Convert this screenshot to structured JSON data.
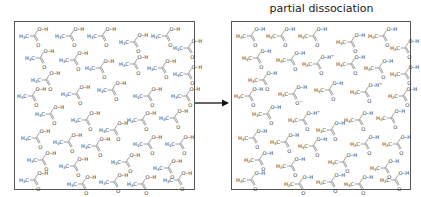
{
  "title": "partial dissociation",
  "arrow": {
    "from_x": 195,
    "to_x": 229,
    "y": 103,
    "color": "#111111"
  },
  "colors": {
    "box_border": "#555555",
    "text": "#333333"
  },
  "molecule": {
    "formula": "CH3COOH",
    "labels": {
      "methyl": "H",
      "methyl_sub": "3",
      "methyl_c": "C",
      "oh": "O–H",
      "carbonyl_o": "O",
      "anion_o": "O",
      "minus": "−",
      "plus": "+"
    }
  },
  "left_box": {
    "label": "undissociated",
    "x": 14,
    "y": 21,
    "w": 181,
    "h": 169,
    "molecules": [
      {
        "x": 4,
        "y": 2,
        "state": "neutral"
      },
      {
        "x": 40,
        "y": 2,
        "state": "neutral"
      },
      {
        "x": 72,
        "y": 2,
        "state": "neutral"
      },
      {
        "x": 104,
        "y": 8,
        "state": "neutral"
      },
      {
        "x": 136,
        "y": 2,
        "state": "neutral"
      },
      {
        "x": 158,
        "y": 14,
        "state": "neutral"
      },
      {
        "x": 10,
        "y": 24,
        "state": "neutral"
      },
      {
        "x": 44,
        "y": 26,
        "state": "neutral"
      },
      {
        "x": 70,
        "y": 34,
        "state": "neutral"
      },
      {
        "x": 104,
        "y": 30,
        "state": "neutral"
      },
      {
        "x": 132,
        "y": 34,
        "state": "neutral"
      },
      {
        "x": 158,
        "y": 40,
        "state": "neutral"
      },
      {
        "x": 16,
        "y": 46,
        "state": "neutral"
      },
      {
        "x": 82,
        "y": 56,
        "state": "neutral"
      },
      {
        "x": 118,
        "y": 62,
        "state": "neutral"
      },
      {
        "x": 156,
        "y": 62,
        "state": "neutral"
      },
      {
        "x": 2,
        "y": 62,
        "state": "neutral"
      },
      {
        "x": 46,
        "y": 60,
        "state": "neutral"
      },
      {
        "x": 20,
        "y": 80,
        "state": "neutral"
      },
      {
        "x": 56,
        "y": 86,
        "state": "neutral"
      },
      {
        "x": 84,
        "y": 96,
        "state": "neutral"
      },
      {
        "x": 112,
        "y": 86,
        "state": "neutral"
      },
      {
        "x": 144,
        "y": 84,
        "state": "neutral"
      },
      {
        "x": 6,
        "y": 104,
        "state": "neutral"
      },
      {
        "x": 38,
        "y": 108,
        "state": "neutral"
      },
      {
        "x": 66,
        "y": 112,
        "state": "neutral"
      },
      {
        "x": 118,
        "y": 110,
        "state": "neutral"
      },
      {
        "x": 150,
        "y": 110,
        "state": "neutral"
      },
      {
        "x": 12,
        "y": 126,
        "state": "neutral"
      },
      {
        "x": 44,
        "y": 132,
        "state": "neutral"
      },
      {
        "x": 96,
        "y": 128,
        "state": "neutral"
      },
      {
        "x": 138,
        "y": 134,
        "state": "neutral"
      },
      {
        "x": 4,
        "y": 146,
        "state": "neutral"
      },
      {
        "x": 52,
        "y": 150,
        "state": "neutral"
      },
      {
        "x": 84,
        "y": 148,
        "state": "neutral"
      },
      {
        "x": 112,
        "y": 150,
        "state": "neutral"
      },
      {
        "x": 148,
        "y": 146,
        "state": "neutral"
      }
    ]
  },
  "right_box": {
    "label": "partially dissociated",
    "x": 231,
    "y": 21,
    "w": 180,
    "h": 169,
    "molecules": [
      {
        "x": 4,
        "y": 2,
        "state": "neutral"
      },
      {
        "x": 34,
        "y": 2,
        "state": "neutral"
      },
      {
        "x": 66,
        "y": 2,
        "state": "neutral"
      },
      {
        "x": 104,
        "y": 8,
        "state": "neutral"
      },
      {
        "x": 136,
        "y": 2,
        "state": "neutral"
      },
      {
        "x": 158,
        "y": 14,
        "state": "neutral"
      },
      {
        "x": 10,
        "y": 24,
        "state": "neutral"
      },
      {
        "x": 44,
        "y": 26,
        "state": "neutral"
      },
      {
        "x": 70,
        "y": 30,
        "state": "protonated"
      },
      {
        "x": 104,
        "y": 30,
        "state": "neutral"
      },
      {
        "x": 132,
        "y": 34,
        "state": "neutral"
      },
      {
        "x": 158,
        "y": 40,
        "state": "neutral"
      },
      {
        "x": 16,
        "y": 46,
        "state": "neutral"
      },
      {
        "x": 82,
        "y": 56,
        "state": "neutral"
      },
      {
        "x": 118,
        "y": 58,
        "state": "protonated"
      },
      {
        "x": 156,
        "y": 62,
        "state": "neutral"
      },
      {
        "x": 2,
        "y": 62,
        "state": "neutral"
      },
      {
        "x": 46,
        "y": 60,
        "state": "anion"
      },
      {
        "x": 20,
        "y": 80,
        "state": "neutral"
      },
      {
        "x": 56,
        "y": 86,
        "state": "protonated"
      },
      {
        "x": 84,
        "y": 96,
        "state": "neutral"
      },
      {
        "x": 112,
        "y": 86,
        "state": "neutral"
      },
      {
        "x": 144,
        "y": 84,
        "state": "neutral"
      },
      {
        "x": 6,
        "y": 104,
        "state": "neutral"
      },
      {
        "x": 38,
        "y": 108,
        "state": "neutral"
      },
      {
        "x": 66,
        "y": 112,
        "state": "neutral"
      },
      {
        "x": 118,
        "y": 110,
        "state": "neutral"
      },
      {
        "x": 150,
        "y": 110,
        "state": "neutral"
      },
      {
        "x": 12,
        "y": 126,
        "state": "neutral"
      },
      {
        "x": 44,
        "y": 132,
        "state": "neutral"
      },
      {
        "x": 96,
        "y": 128,
        "state": "neutral"
      },
      {
        "x": 138,
        "y": 134,
        "state": "neutral"
      },
      {
        "x": 4,
        "y": 146,
        "state": "neutral"
      },
      {
        "x": 52,
        "y": 150,
        "state": "neutral"
      },
      {
        "x": 84,
        "y": 148,
        "state": "neutral"
      },
      {
        "x": 112,
        "y": 150,
        "state": "neutral"
      },
      {
        "x": 148,
        "y": 146,
        "state": "neutral"
      }
    ]
  }
}
